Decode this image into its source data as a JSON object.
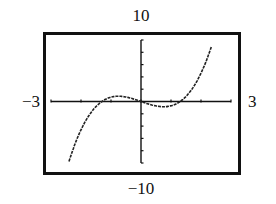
{
  "chart_data": {
    "type": "line",
    "title": "",
    "xlabel": "",
    "ylabel": "",
    "window": {
      "xmin": -3,
      "xmax": 3,
      "ymin": -10,
      "ymax": 10,
      "xscl": 1,
      "yscl": 2
    },
    "xlim": [
      -3,
      3
    ],
    "ylim": [
      -10,
      10
    ],
    "grid": false,
    "legend": null,
    "labels": {
      "ymax": "10",
      "ymin": "−10",
      "xmin": "−3",
      "xmax": "3"
    },
    "series": [
      {
        "name": "f(x)",
        "approx_expression": "x^3 - 1.7x",
        "x": [
          -2.4,
          -2.2,
          -2.0,
          -1.8,
          -1.6,
          -1.4,
          -1.3,
          -1.2,
          -1.0,
          -0.75,
          -0.5,
          -0.25,
          0,
          0.25,
          0.5,
          0.75,
          1.0,
          1.2,
          1.3,
          1.4,
          1.6,
          1.8,
          2.0,
          2.2,
          2.35
        ],
        "y": [
          -9.74,
          -6.91,
          -4.6,
          -2.77,
          -1.38,
          -0.36,
          0.0,
          0.31,
          0.7,
          0.85,
          0.73,
          0.41,
          0.0,
          -0.41,
          -0.73,
          -0.85,
          -0.7,
          -0.31,
          0.0,
          0.36,
          1.38,
          2.77,
          4.6,
          6.91,
          8.98
        ]
      }
    ],
    "x_ticks": [
      -3,
      -2,
      -1,
      0,
      1,
      2,
      3
    ],
    "y_ticks": [
      -10,
      -8,
      -6,
      -4,
      -2,
      0,
      2,
      4,
      6,
      8,
      10
    ]
  },
  "colors": {
    "frame": "#111111",
    "axis": "#111111",
    "curve": "#222222",
    "background": "#ffffff"
  }
}
